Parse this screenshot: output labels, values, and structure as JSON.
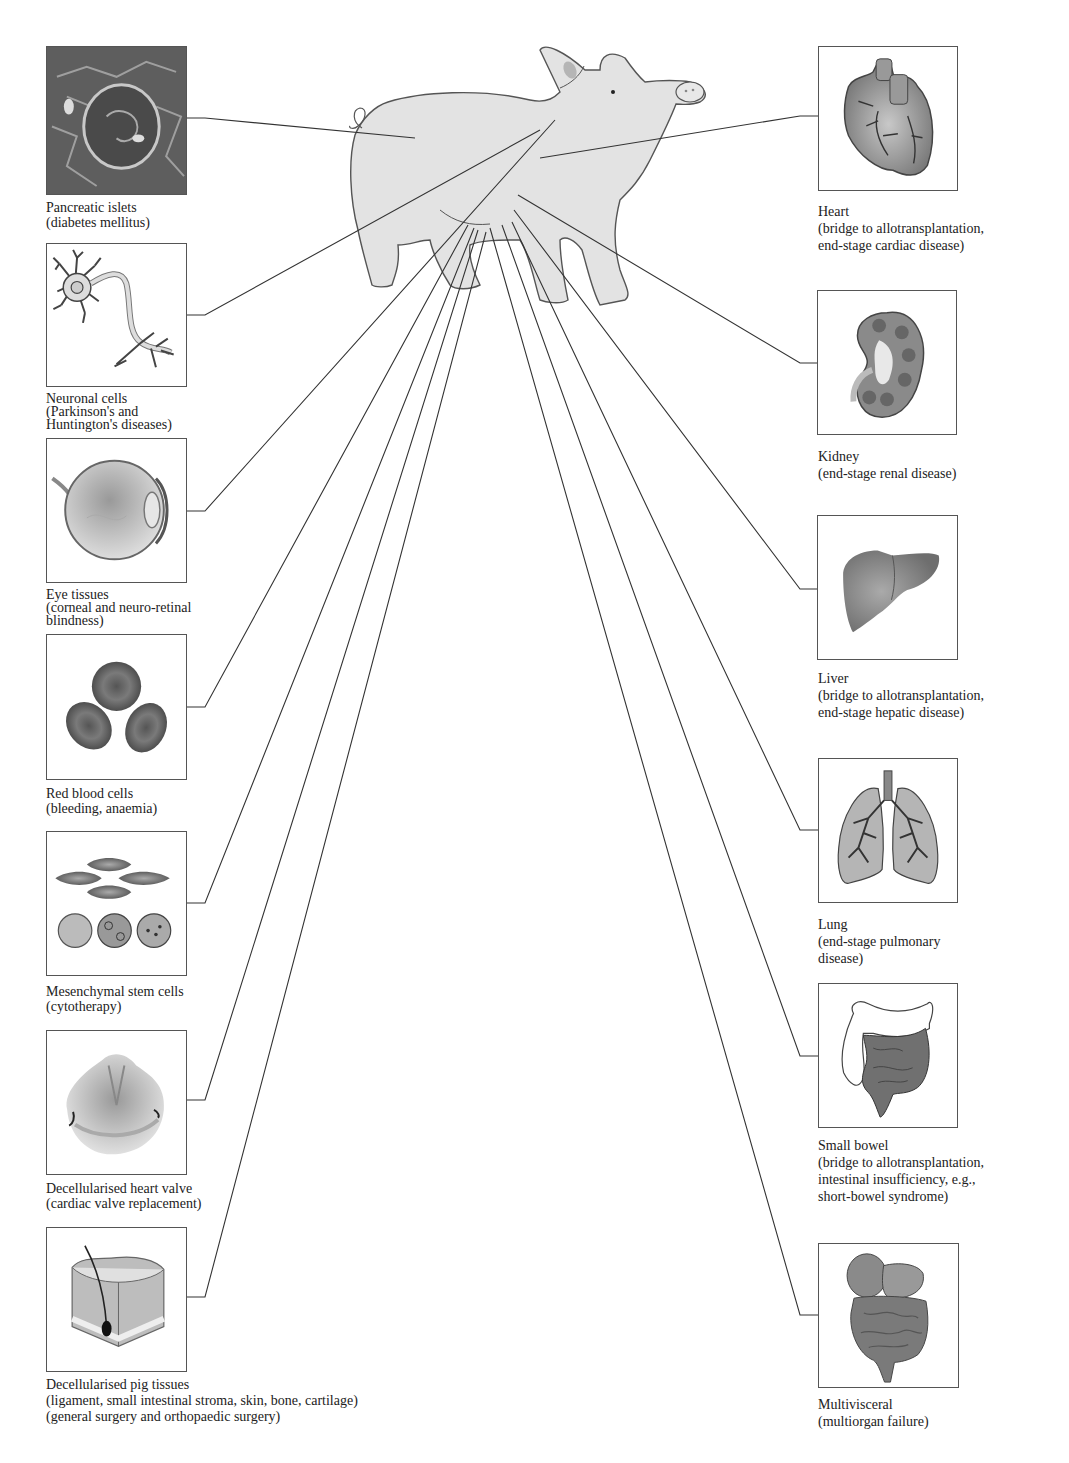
{
  "figure": {
    "center_image": "pig-illustration",
    "left_panels": [
      {
        "id": "pancreatic-islets",
        "icon": "pancreatic-islet-micrograph",
        "name": "Pancreatic islets",
        "desc": [
          "(diabetes mellitus)"
        ]
      },
      {
        "id": "neuronal-cells",
        "icon": "neuron-icon",
        "name": "Neuronal cells",
        "desc": [
          "(Parkinson's and",
          "Huntington's diseases)"
        ]
      },
      {
        "id": "eye-tissues",
        "icon": "eye-icon",
        "name": "Eye tissues",
        "desc": [
          "(corneal and neuro-retinal",
          "blindness)"
        ]
      },
      {
        "id": "red-blood-cells",
        "icon": "red-blood-cells-icon",
        "name": "Red blood cells",
        "desc": [
          "(bleeding, anaemia)"
        ]
      },
      {
        "id": "mesenchymal-stem-cells",
        "icon": "stem-cells-icon",
        "name": "Mesenchymal stem cells",
        "desc": [
          "(cytotherapy)"
        ]
      },
      {
        "id": "heart-valve",
        "icon": "heart-valve-icon",
        "name": "Decellularised heart valve",
        "desc": [
          "(cardiac valve replacement)"
        ]
      },
      {
        "id": "pig-tissues",
        "icon": "skin-tissue-icon",
        "name": "Decellularised pig tissues",
        "desc": [
          "(ligament, small intestinal stroma, skin, bone, cartilage)",
          "(general surgery and orthopaedic surgery)"
        ]
      }
    ],
    "right_panels": [
      {
        "id": "heart",
        "icon": "heart-icon",
        "name": "Heart",
        "desc": [
          "(bridge to allotransplantation,",
          "end-stage cardiac disease)"
        ]
      },
      {
        "id": "kidney",
        "icon": "kidney-icon",
        "name": "Kidney",
        "desc": [
          "(end-stage renal disease)"
        ]
      },
      {
        "id": "liver",
        "icon": "liver-icon",
        "name": "Liver",
        "desc": [
          "(bridge to allotransplantation,",
          "end-stage hepatic disease)"
        ]
      },
      {
        "id": "lung",
        "icon": "lung-icon",
        "name": "Lung",
        "desc": [
          "(end-stage pulmonary",
          "disease)"
        ]
      },
      {
        "id": "small-bowel",
        "icon": "intestine-icon",
        "name": "Small bowel",
        "desc": [
          "(bridge to allotransplantation,",
          "intestinal insufficiency, e.g.,",
          "short-bowel syndrome)"
        ]
      },
      {
        "id": "multivisceral",
        "icon": "multivisceral-icon",
        "name": "Multivisceral",
        "desc": [
          "(multiorgan failure)"
        ]
      }
    ],
    "colors": {
      "pig_fill": "#e3e3e3",
      "outline": "#555555",
      "organ": "#8a8a8a",
      "line": "#333333"
    }
  }
}
